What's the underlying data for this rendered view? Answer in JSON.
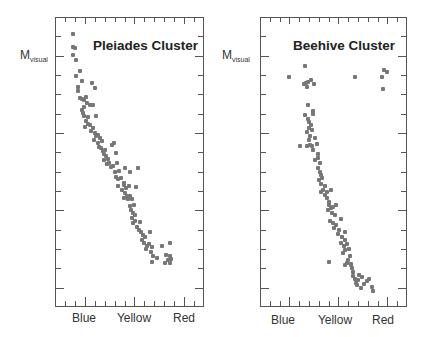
{
  "chart_data": [
    {
      "type": "scatter",
      "title": "Pleiades Cluster",
      "ylabel": "M_visual",
      "ylabel_main": "M",
      "ylabel_sub": "visual",
      "xlabel": "",
      "x_tick_labels": [
        "Blue",
        "Yellow",
        "Red"
      ],
      "grid": false,
      "point_color": "#777777",
      "frame": {
        "left": 55,
        "top": 17,
        "width": 149,
        "height": 290
      },
      "points_px": [
        [
          73,
          34
        ],
        [
          73,
          47
        ],
        [
          75,
          48
        ],
        [
          73,
          55
        ],
        [
          76,
          60
        ],
        [
          80,
          71
        ],
        [
          76,
          76
        ],
        [
          82,
          81
        ],
        [
          78,
          87
        ],
        [
          78,
          91
        ],
        [
          92,
          83
        ],
        [
          95,
          88
        ],
        [
          80,
          98
        ],
        [
          82,
          99
        ],
        [
          84,
          100
        ],
        [
          86,
          97
        ],
        [
          87,
          103
        ],
        [
          84,
          107
        ],
        [
          90,
          105
        ],
        [
          93,
          105
        ],
        [
          82,
          110
        ],
        [
          83,
          113
        ],
        [
          84,
          116
        ],
        [
          88,
          117
        ],
        [
          96,
          116
        ],
        [
          86,
          121
        ],
        [
          88,
          124
        ],
        [
          85,
          127
        ],
        [
          90,
          125
        ],
        [
          91,
          131
        ],
        [
          93,
          128
        ],
        [
          95,
          133
        ],
        [
          96,
          136
        ],
        [
          98,
          135
        ],
        [
          100,
          138
        ],
        [
          94,
          140
        ],
        [
          98,
          143
        ],
        [
          102,
          141
        ],
        [
          99,
          147
        ],
        [
          101,
          148
        ],
        [
          103,
          151
        ],
        [
          105,
          150
        ],
        [
          104,
          154
        ],
        [
          106,
          156
        ],
        [
          108,
          159
        ],
        [
          112,
          145
        ],
        [
          114,
          143
        ],
        [
          116,
          153
        ],
        [
          104,
          160
        ],
        [
          107,
          164
        ],
        [
          109,
          163
        ],
        [
          111,
          167
        ],
        [
          113,
          166
        ],
        [
          117,
          163
        ],
        [
          115,
          172
        ],
        [
          119,
          171
        ],
        [
          125,
          168
        ],
        [
          138,
          168
        ],
        [
          130,
          172
        ],
        [
          116,
          177
        ],
        [
          118,
          179
        ],
        [
          121,
          178
        ],
        [
          124,
          183
        ],
        [
          118,
          186
        ],
        [
          124,
          185
        ],
        [
          126,
          188
        ],
        [
          129,
          186
        ],
        [
          122,
          190
        ],
        [
          125,
          193
        ],
        [
          127,
          196
        ],
        [
          124,
          198
        ],
        [
          130,
          196
        ],
        [
          128,
          199
        ],
        [
          132,
          199
        ],
        [
          136,
          187
        ],
        [
          134,
          205
        ],
        [
          130,
          206
        ],
        [
          131,
          210
        ],
        [
          133,
          213
        ],
        [
          135,
          215
        ],
        [
          132,
          218
        ],
        [
          135,
          221
        ],
        [
          133,
          223
        ],
        [
          140,
          222
        ],
        [
          137,
          227
        ],
        [
          139,
          230
        ],
        [
          141,
          232
        ],
        [
          143,
          235
        ],
        [
          145,
          237
        ],
        [
          150,
          232
        ],
        [
          142,
          240
        ],
        [
          144,
          243
        ],
        [
          147,
          246
        ],
        [
          149,
          244
        ],
        [
          152,
          247
        ],
        [
          146,
          249
        ],
        [
          151,
          252
        ],
        [
          153,
          256
        ],
        [
          157,
          258
        ],
        [
          152,
          262
        ],
        [
          162,
          246
        ],
        [
          170,
          243
        ],
        [
          166,
          255
        ],
        [
          165,
          263
        ],
        [
          170,
          256
        ],
        [
          168,
          260
        ],
        [
          171,
          259
        ],
        [
          170,
          263
        ]
      ]
    },
    {
      "type": "scatter",
      "title": "Beehive Cluster",
      "ylabel": "M_visual",
      "ylabel_main": "M",
      "ylabel_sub": "visual",
      "xlabel": "",
      "x_tick_labels": [
        "Blue",
        "Yellow",
        "Red"
      ],
      "grid": false,
      "point_color": "#777777",
      "frame": {
        "left": 260,
        "top": 17,
        "width": 147,
        "height": 290
      },
      "points_px": [
        [
          305,
          66
        ],
        [
          289,
          77
        ],
        [
          355,
          77
        ],
        [
          382,
          77
        ],
        [
          384,
          70
        ],
        [
          387,
          72
        ],
        [
          383,
          89
        ],
        [
          304,
          84
        ],
        [
          306,
          83
        ],
        [
          308,
          82
        ],
        [
          311,
          80
        ],
        [
          314,
          84
        ],
        [
          307,
          87
        ],
        [
          308,
          105
        ],
        [
          305,
          115
        ],
        [
          313,
          111
        ],
        [
          313,
          114
        ],
        [
          308,
          119
        ],
        [
          309,
          122
        ],
        [
          311,
          125
        ],
        [
          309,
          128
        ],
        [
          312,
          130
        ],
        [
          307,
          132
        ],
        [
          310,
          136
        ],
        [
          309,
          140
        ],
        [
          315,
          138
        ],
        [
          307,
          146
        ],
        [
          310,
          145
        ],
        [
          312,
          146
        ],
        [
          317,
          144
        ],
        [
          300,
          146
        ],
        [
          313,
          150
        ],
        [
          318,
          154
        ],
        [
          315,
          160
        ],
        [
          318,
          158
        ],
        [
          320,
          163
        ],
        [
          318,
          168
        ],
        [
          320,
          172
        ],
        [
          321,
          175
        ],
        [
          319,
          180
        ],
        [
          322,
          178
        ],
        [
          321,
          184
        ],
        [
          325,
          186
        ],
        [
          323,
          190
        ],
        [
          321,
          192
        ],
        [
          325,
          195
        ],
        [
          327,
          192
        ],
        [
          331,
          190
        ],
        [
          327,
          198
        ],
        [
          329,
          202
        ],
        [
          329,
          205
        ],
        [
          331,
          208
        ],
        [
          328,
          210
        ],
        [
          333,
          207
        ],
        [
          336,
          205
        ],
        [
          332,
          213
        ],
        [
          335,
          215
        ],
        [
          330,
          221
        ],
        [
          333,
          223
        ],
        [
          341,
          219
        ],
        [
          336,
          225
        ],
        [
          334,
          228
        ],
        [
          339,
          230
        ],
        [
          338,
          234
        ],
        [
          345,
          232
        ],
        [
          342,
          237
        ],
        [
          345,
          240
        ],
        [
          341,
          243
        ],
        [
          344,
          246
        ],
        [
          347,
          244
        ],
        [
          345,
          250
        ],
        [
          349,
          249
        ],
        [
          343,
          253
        ],
        [
          350,
          256
        ],
        [
          348,
          260
        ],
        [
          347,
          263
        ],
        [
          351,
          264
        ],
        [
          345,
          265
        ],
        [
          351,
          265
        ],
        [
          352,
          268
        ],
        [
          353,
          272
        ],
        [
          353,
          276
        ],
        [
          355,
          279
        ],
        [
          359,
          275
        ],
        [
          358,
          280
        ],
        [
          356,
          283
        ],
        [
          362,
          277
        ],
        [
          364,
          284
        ],
        [
          367,
          281
        ],
        [
          369,
          279
        ],
        [
          357,
          285
        ],
        [
          361,
          288
        ],
        [
          372,
          287
        ],
        [
          373,
          291
        ],
        [
          329,
          262
        ]
      ]
    }
  ],
  "panels": [
    {
      "title": "Pleiades Cluster",
      "ylabel_main": "M",
      "ylabel_sub": "visual",
      "x_labels": [
        "Blue",
        "Yellow",
        "Red"
      ]
    },
    {
      "title": "Beehive Cluster",
      "ylabel_main": "M",
      "ylabel_sub": "visual",
      "x_labels": [
        "Blue",
        "Yellow",
        "Red"
      ]
    }
  ]
}
